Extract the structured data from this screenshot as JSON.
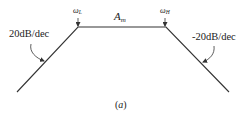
{
  "diagram": {
    "type": "bode-magnitude-asymptote",
    "labels": {
      "left_slope": "20dB/dec",
      "right_slope": "-20dB/dec",
      "lower_corner_symbol": "ω",
      "lower_corner_sub": "L",
      "upper_corner_symbol": "ω",
      "upper_corner_sub": "H",
      "midband_symbol": "A",
      "midband_sub": "m",
      "caption_open": "(",
      "caption_letter": "a",
      "caption_close": ")"
    },
    "colors": {
      "line": "#333333",
      "text": "#222222",
      "background": "#ffffff"
    }
  }
}
